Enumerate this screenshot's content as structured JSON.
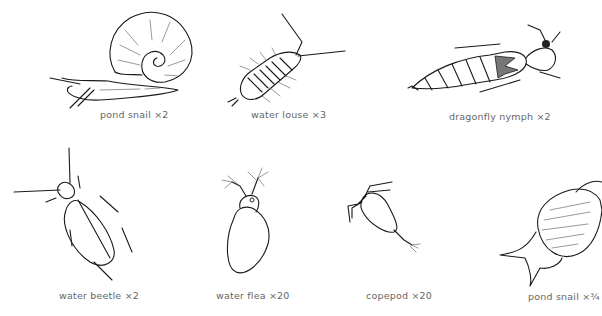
{
  "figure": {
    "specimens": [
      {
        "name": "pond snail",
        "magnification": "×2",
        "caption": "pond snail  ×2"
      },
      {
        "name": "water louse",
        "magnification": "×3",
        "caption": "water louse  ×3"
      },
      {
        "name": "dragonfly nymph",
        "magnification": "×2",
        "caption": "dragonfly nymph  ×2"
      },
      {
        "name": "water beetle",
        "magnification": "×2",
        "caption": "water beetle ×2"
      },
      {
        "name": "water flea",
        "magnification": "×20",
        "caption": "water flea  ×20"
      },
      {
        "name": "copepod",
        "magnification": "×20",
        "caption": "copepod  ×20"
      },
      {
        "name": "pond snail",
        "magnification": "×¾",
        "caption": "pond snail ×¾"
      }
    ]
  }
}
